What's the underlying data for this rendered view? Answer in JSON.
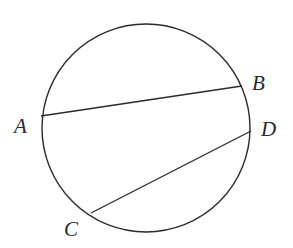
{
  "diagram": {
    "type": "circle-with-chords",
    "circle": {
      "cx": 146,
      "cy": 128,
      "r": 104
    },
    "points": [
      {
        "id": "A",
        "label": "A",
        "x": 41,
        "y": 116,
        "label_x": 14,
        "label_y": 133
      },
      {
        "id": "B",
        "label": "B",
        "x": 242,
        "y": 86,
        "label_x": 252,
        "label_y": 90
      },
      {
        "id": "C",
        "label": "C",
        "x": 91,
        "y": 213,
        "label_x": 64,
        "label_y": 236
      },
      {
        "id": "D",
        "label": "D",
        "x": 251,
        "y": 131,
        "label_x": 261,
        "label_y": 136
      }
    ],
    "chords": [
      {
        "name": "AB",
        "from": "A",
        "to": "B"
      },
      {
        "name": "CD",
        "from": "C",
        "to": "D"
      }
    ],
    "stroke_color": "#2a2a2a"
  }
}
